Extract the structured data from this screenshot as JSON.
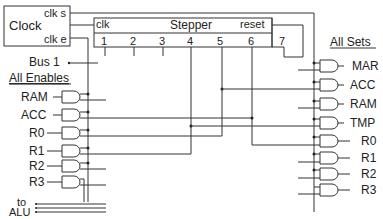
{
  "clock": {
    "title": "Clock",
    "output_s": "clk s",
    "output_e": "clk e"
  },
  "stepper": {
    "title": "Stepper",
    "clk_label": "clk",
    "reset_label": "reset",
    "steps": [
      "1",
      "2",
      "3",
      "4",
      "5",
      "6",
      "7"
    ]
  },
  "bus": {
    "label": "Bus 1"
  },
  "enables": {
    "heading": "All Enables",
    "items": [
      "RAM",
      "ACC",
      "R0",
      "R1",
      "R2",
      "R3"
    ]
  },
  "sets": {
    "heading": "All Sets",
    "items": [
      "MAR",
      "ACC",
      "RAM",
      "TMP",
      "R0",
      "R1",
      "R2",
      "R3"
    ]
  },
  "alu": {
    "label_line1": "to",
    "label_line2": "ALU"
  },
  "colors": {
    "wire": "#333333",
    "background": "#ffffff",
    "text": "#222222"
  }
}
